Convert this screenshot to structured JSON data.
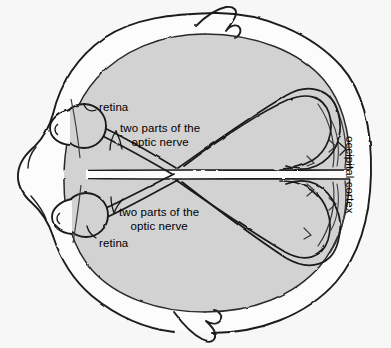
{
  "figure": {
    "view": "top-down (axial) section through head and brain",
    "style": "hand-drawn ink line illustration with gray brain shading",
    "background_color": "#f7f7f7",
    "brain_fill_color": "#d0d0d0",
    "ink_color": "#1a1a1a",
    "skull_fill_color": "#fcfcfc"
  },
  "labels": {
    "retina_top": "retina",
    "optic_nerve_top": "two parts of the\noptic nerve",
    "optic_nerve_bottom": "two parts of the\noptic nerve",
    "retina_bottom": "retina",
    "occipital_cortex": "occipital cortex"
  },
  "structures": [
    {
      "name": "skull-outline",
      "label": "",
      "description": "outer head contour with nose at left and ear protrusions top and bottom"
    },
    {
      "name": "nose",
      "label": "",
      "description": "nose profile on the left edge"
    },
    {
      "name": "ear-top",
      "label": "",
      "description": "ear protrusion upper side"
    },
    {
      "name": "ear-bottom",
      "label": "",
      "description": "ear protrusion lower side"
    },
    {
      "name": "brain-left-hemisphere",
      "label": "",
      "description": "upper gray hemisphere in the axial view"
    },
    {
      "name": "brain-right-hemisphere",
      "label": "",
      "description": "lower gray hemisphere in the axial view"
    },
    {
      "name": "longitudinal-fissure",
      "label": "",
      "description": "midline gap dividing the two hemispheres"
    },
    {
      "name": "eyeball-top",
      "label": "retina",
      "description": "upper eye globe with lens"
    },
    {
      "name": "eyeball-bottom",
      "label": "retina",
      "description": "lower eye globe with lens"
    },
    {
      "name": "optic-nerve-top",
      "label": "two parts of the optic nerve",
      "description": "band of two parallel fibers leaving upper eye"
    },
    {
      "name": "optic-nerve-bottom",
      "label": "two parts of the optic nerve",
      "description": "band of two parallel fibers leaving lower eye"
    },
    {
      "name": "optic-chiasm",
      "label": "",
      "description": "X crossing of the nerve fibers at the midline"
    },
    {
      "name": "optic-tract-loop-top",
      "label": "",
      "description": "fiber loop sweeping back to the occipital pole"
    },
    {
      "name": "optic-tract-loop-bottom",
      "label": "",
      "description": "fiber loop sweeping back to the occipital pole"
    },
    {
      "name": "occipital-cortex",
      "label": "occipital cortex",
      "description": "posterior brain region at right where fibers terminate"
    }
  ]
}
